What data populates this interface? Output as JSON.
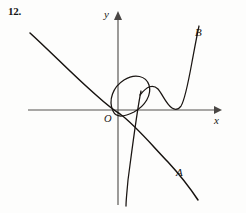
{
  "figure": {
    "problem_number": "12.",
    "background_color": "#fdfdfc",
    "ink_color": "#16120f",
    "axis_color": "#55524f"
  },
  "axes": {
    "y_label": "y",
    "x_label": "x",
    "origin_label": "O",
    "origin_px": {
      "x": 118,
      "y": 110
    },
    "x_axis_y_px": 110,
    "y_axis_x_px": 118,
    "x_axis_extent_px": {
      "from": 28,
      "to": 221
    },
    "y_axis_extent_px": {
      "from": 12,
      "to": 205
    },
    "x_arrow_tip_px": {
      "x": 221,
      "y": 110
    },
    "y_arrow_tip_px": {
      "x": 118,
      "y": 12
    },
    "ticks": [],
    "gridlines": false
  },
  "curves": [
    {
      "id": "curve-a",
      "label": "A",
      "label_px": {
        "x": 180,
        "y": 173
      },
      "description": "monotonically decreasing curve from upper-left, flattening near the origin then descending steeply to lower-right",
      "path": "M 30 33 C 52 53, 74 76, 96 95 C 106 104, 112 109, 120 114 C 134 124, 150 143, 168 162 C 180 175, 190 188, 198 200"
    },
    {
      "id": "curve-b",
      "label": "B",
      "label_px": {
        "x": 199,
        "y": 33
      },
      "description": "cubic-like curve with a local maximum, a local minimum touching the x-axis, then rising steeply to upper-right",
      "path": "M 140 95 C 147 86, 153 84, 158 89 C 163 95, 166 104, 172 108 C 175 110, 178 110, 181 106 C 185 100, 188 84, 192 62 C 195 46, 197 35, 199 26"
    },
    {
      "id": "curve-loop",
      "label": "",
      "label_px": null,
      "description": "tilted closed loop (oval) passing through the origin region, tilted up to the right",
      "path": "M 113 111 C 108 100, 113 87, 124 80 C 135 73, 146 76, 149 85 C 152 95, 145 106, 134 112 C 124 117, 116 118, 113 111 Z"
    },
    {
      "id": "curve-steep-branch",
      "label": "",
      "label_px": null,
      "description": "steep near-vertical branch descending from the loop area to the bottom of the figure",
      "path": "M 141 91 C 137 110, 132 150, 128 180 C 127 192, 126 200, 126 206"
    }
  ],
  "labels": {
    "a": "A",
    "b": "B",
    "x": "x",
    "y": "y",
    "origin": "O"
  }
}
